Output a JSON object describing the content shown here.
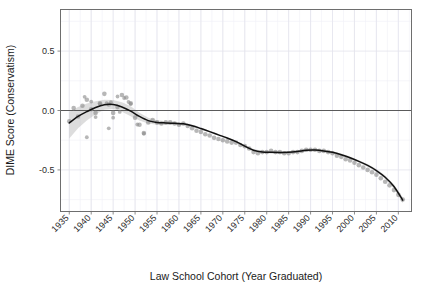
{
  "chart_data": {
    "type": "scatter",
    "title": "",
    "subtitle": "",
    "xlabel": "Law School Cohort (Year Graduated)",
    "ylabel": "DIME Score (Conservatism)",
    "xlim": [
      1933,
      2013
    ],
    "ylim": [
      -0.85,
      0.85
    ],
    "grid": true,
    "legend": null,
    "xticks": [
      1935,
      1940,
      1945,
      1950,
      1955,
      1960,
      1965,
      1970,
      1975,
      1980,
      1985,
      1990,
      1995,
      2000,
      2005,
      2010
    ],
    "xtick_labels": [
      "1935",
      "1940",
      "1945",
      "1950",
      "1955",
      "1960",
      "1965",
      "1970",
      "1975",
      "1980",
      "1985",
      "1990",
      "1995",
      "2000",
      "2005",
      "2010"
    ],
    "yticks": [
      0.5,
      0.0,
      -0.5
    ],
    "ytick_labels": [
      "0.5",
      "0.0",
      "-0.5"
    ],
    "reference_lines": [
      {
        "axis": "y",
        "value": 0.0,
        "color": "#4a4a4a"
      }
    ],
    "colors": {
      "point": "#8a8a8a",
      "line": "#111111",
      "ribbon": "#b4b4b4",
      "grid_major": "#e3e3ec",
      "grid_minor": "#f0f0f6",
      "panel_border": "#6e6e6e",
      "background": "#ffffff"
    },
    "annotations": [],
    "series": [
      {
        "name": "Cohort mean DIME score",
        "type": "scatter",
        "x": [
          1935,
          1936,
          1937,
          1938,
          1939,
          1940,
          1941,
          1942,
          1943,
          1944,
          1945,
          1946,
          1947,
          1948,
          1949,
          1950,
          1951,
          1952,
          1953,
          1954,
          1955,
          1956,
          1957,
          1958,
          1959,
          1960,
          1961,
          1962,
          1963,
          1964,
          1965,
          1966,
          1967,
          1968,
          1969,
          1970,
          1971,
          1972,
          1973,
          1974,
          1975,
          1976,
          1977,
          1978,
          1979,
          1980,
          1981,
          1982,
          1983,
          1984,
          1985,
          1986,
          1987,
          1988,
          1989,
          1990,
          1991,
          1992,
          1993,
          1994,
          1995,
          1996,
          1997,
          1998,
          1999,
          2000,
          2001,
          2002,
          2003,
          2004,
          2005,
          2006,
          2007,
          2008,
          2009,
          2010,
          2011
        ],
        "y": [
          -0.09,
          0.02,
          -0.05,
          0.04,
          0.09,
          0.01,
          -0.02,
          0.06,
          0.14,
          0.05,
          -0.02,
          0.03,
          0.13,
          0.11,
          0.06,
          -0.06,
          -0.12,
          -0.19,
          -0.1,
          -0.08,
          -0.1,
          -0.11,
          -0.1,
          -0.1,
          -0.11,
          -0.12,
          -0.11,
          -0.13,
          -0.15,
          -0.17,
          -0.18,
          -0.2,
          -0.21,
          -0.23,
          -0.24,
          -0.25,
          -0.26,
          -0.27,
          -0.27,
          -0.29,
          -0.3,
          -0.32,
          -0.35,
          -0.36,
          -0.35,
          -0.35,
          -0.34,
          -0.35,
          -0.35,
          -0.36,
          -0.36,
          -0.35,
          -0.35,
          -0.34,
          -0.33,
          -0.33,
          -0.33,
          -0.34,
          -0.34,
          -0.35,
          -0.36,
          -0.38,
          -0.39,
          -0.41,
          -0.42,
          -0.44,
          -0.46,
          -0.48,
          -0.5,
          -0.52,
          -0.54,
          -0.57,
          -0.6,
          -0.63,
          -0.67,
          -0.71,
          -0.75
        ]
      },
      {
        "name": "LOESS smooth",
        "type": "line",
        "x": [
          1935,
          1937,
          1939,
          1941,
          1943,
          1945,
          1947,
          1949,
          1951,
          1953,
          1955,
          1957,
          1959,
          1961,
          1963,
          1965,
          1967,
          1969,
          1971,
          1973,
          1975,
          1977,
          1979,
          1981,
          1983,
          1985,
          1987,
          1989,
          1991,
          1993,
          1995,
          1997,
          1999,
          2001,
          2003,
          2005,
          2007,
          2009,
          2011
        ],
        "y": [
          -0.105,
          -0.05,
          -0.01,
          0.025,
          0.048,
          0.05,
          0.03,
          -0.005,
          -0.05,
          -0.085,
          -0.1,
          -0.105,
          -0.108,
          -0.112,
          -0.128,
          -0.152,
          -0.178,
          -0.205,
          -0.232,
          -0.262,
          -0.3,
          -0.335,
          -0.35,
          -0.352,
          -0.353,
          -0.352,
          -0.345,
          -0.335,
          -0.333,
          -0.34,
          -0.352,
          -0.372,
          -0.398,
          -0.428,
          -0.462,
          -0.505,
          -0.562,
          -0.64,
          -0.755
        ]
      },
      {
        "name": "95% confidence band (upper)",
        "type": "ribbon_upper",
        "x": [
          1935,
          1937,
          1939,
          1941,
          1943,
          1945,
          1947,
          1949,
          1951,
          1953,
          1955,
          1957,
          1959,
          1961,
          1963,
          1965,
          1967,
          1969,
          1971,
          1973,
          1975,
          1977,
          1979,
          1981,
          1983,
          1985,
          1987,
          1989,
          1991,
          1993,
          1995,
          1997,
          1999,
          2001,
          2003,
          2005,
          2007,
          2009,
          2011
        ],
        "y": [
          -0.01,
          0.03,
          0.058,
          0.078,
          0.09,
          0.088,
          0.07,
          0.035,
          -0.018,
          -0.062,
          -0.082,
          -0.09,
          -0.095,
          -0.1,
          -0.118,
          -0.143,
          -0.17,
          -0.197,
          -0.224,
          -0.254,
          -0.291,
          -0.324,
          -0.339,
          -0.342,
          -0.343,
          -0.342,
          -0.335,
          -0.325,
          -0.323,
          -0.33,
          -0.342,
          -0.362,
          -0.388,
          -0.418,
          -0.451,
          -0.493,
          -0.548,
          -0.622,
          -0.73
        ]
      },
      {
        "name": "95% confidence band (lower)",
        "type": "ribbon_lower",
        "x": [
          1935,
          1937,
          1939,
          1941,
          1943,
          1945,
          1947,
          1949,
          1951,
          1953,
          1955,
          1957,
          1959,
          1961,
          1963,
          1965,
          1967,
          1969,
          1971,
          1973,
          1975,
          1977,
          1979,
          1981,
          1983,
          1985,
          1987,
          1989,
          1991,
          1993,
          1995,
          1997,
          1999,
          2001,
          2003,
          2005,
          2007,
          2009,
          2011
        ],
        "y": [
          -0.235,
          -0.15,
          -0.085,
          -0.032,
          0.006,
          0.012,
          -0.01,
          -0.048,
          -0.085,
          -0.11,
          -0.12,
          -0.122,
          -0.122,
          -0.124,
          -0.138,
          -0.161,
          -0.186,
          -0.213,
          -0.24,
          -0.27,
          -0.309,
          -0.346,
          -0.361,
          -0.362,
          -0.363,
          -0.362,
          -0.355,
          -0.345,
          -0.343,
          -0.35,
          -0.362,
          -0.382,
          -0.408,
          -0.438,
          -0.473,
          -0.517,
          -0.576,
          -0.658,
          -0.78
        ]
      }
    ],
    "outlier_points": {
      "name": "sparse early-cohort observations",
      "x": [
        1938.5,
        1940.0,
        1942.0,
        1943.5,
        1944.5,
        1946.0,
        1947.5,
        1948.5,
        1949.0,
        1945.0,
        1946.5,
        1950.5,
        1952.0,
        1941.0,
        1944.0,
        1939.0
      ],
      "y": [
        0.115,
        0.075,
        0.055,
        0.062,
        0.07,
        0.118,
        0.105,
        0.072,
        0.055,
        -0.06,
        -0.012,
        -0.118,
        -0.195,
        -0.055,
        -0.15,
        -0.225
      ]
    }
  },
  "axes": {
    "x_title": "Law School Cohort (Year Graduated)",
    "y_title": "DIME Score (Conservatism)"
  }
}
